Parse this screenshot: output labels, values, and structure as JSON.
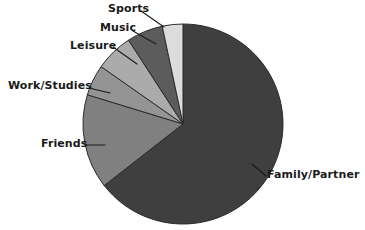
{
  "chart_data": {
    "type": "pie",
    "title": "",
    "subtitle": "",
    "xlabel": "",
    "ylabel": "",
    "legend_position": "none",
    "grid": false,
    "labels_placement": "outside-with-leader-lines",
    "categories": [
      "Family/Partner",
      "Friends",
      "Work/Studies",
      "Leisure",
      "Music",
      "Sports"
    ],
    "values": [
      64,
      15,
      5,
      6,
      6,
      4
    ],
    "value_unit": "percent",
    "start_angle_deg": 0,
    "direction": "clockwise",
    "slices": [
      {
        "label": "Family/Partner",
        "value": 64,
        "color": "#3f3f3f",
        "start_deg": 0,
        "end_deg": 232
      },
      {
        "label": "Friends",
        "value": 15,
        "color": "#808080",
        "start_deg": 232,
        "end_deg": 287
      },
      {
        "label": "Work/Studies",
        "value": 5,
        "color": "#949494",
        "start_deg": 287,
        "end_deg": 305
      },
      {
        "label": "Leisure",
        "value": 6,
        "color": "#ababab",
        "start_deg": 305,
        "end_deg": 327
      },
      {
        "label": "Music",
        "value": 6,
        "color": "#5c5c5c",
        "start_deg": 327,
        "end_deg": 348
      },
      {
        "label": "Sports",
        "value": 4,
        "color": "#dcdcdc",
        "start_deg": 348,
        "end_deg": 360
      }
    ],
    "geometry": {
      "center_x": 183,
      "center_y": 124,
      "radius": 100
    },
    "colors": {
      "family_partner": "#3f3f3f",
      "friends": "#808080",
      "work_studies": "#949494",
      "leisure": "#ababab",
      "music": "#5c5c5c",
      "sports": "#dcdcdc",
      "outline": "#2b2b2b",
      "leader_line": "#1a1a1a",
      "background": "#ffffff",
      "label_text": "#1a1a1a"
    }
  },
  "labels": {
    "sports": "Sports",
    "music": "Music",
    "leisure": "Leisure",
    "work_studies": "Work/Studies",
    "friends": "Friends",
    "family_partner": "Family/Partner"
  }
}
